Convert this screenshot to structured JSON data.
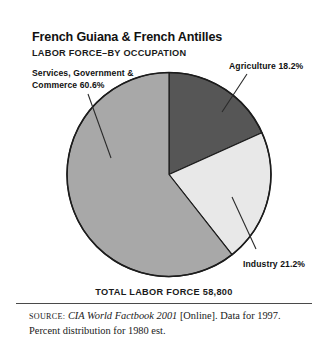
{
  "figure": {
    "title": "French Guiana & French Antilles",
    "subtitle": "LABOR FORCE–BY OCCUPATION",
    "total_label": "TOTAL LABOR FORCE 58,800",
    "source": {
      "label": "SOURCE:",
      "work": "CIA World Factbook 2001",
      "rest": " [Online]. Data for 1997. Percent distribution for 1980 est."
    }
  },
  "labels": {
    "services": "Services, Government &\nCommerce 60.6%",
    "agriculture": "Agriculture 18.2%",
    "industry": "Industry 21.2%"
  },
  "colors": {
    "services": "#a8a8a8",
    "agriculture": "#565656",
    "industry": "#e8e8e8",
    "outline": "#1c1c1c",
    "frame": "#3b3b3b",
    "text": "#111111"
  },
  "chart_data": {
    "type": "pie",
    "subtitle": "LABOR FORCE–BY OCCUPATION",
    "unit": "percent",
    "total": 58800,
    "total_label": "TOTAL LABOR FORCE 58,800",
    "categories": [
      "Agriculture",
      "Industry",
      "Services, Government & Commerce"
    ],
    "values": [
      18.2,
      21.2,
      60.6
    ],
    "slice_colors": [
      "#565656",
      "#e8e8e8",
      "#a8a8a8"
    ],
    "start_angle_deg": 0,
    "direction": "clockwise",
    "legend": "none",
    "labels_inline": true,
    "annotations": [
      "Agriculture 18.2%",
      "Industry 21.2%",
      "Services, Government & Commerce 60.6%"
    ]
  }
}
